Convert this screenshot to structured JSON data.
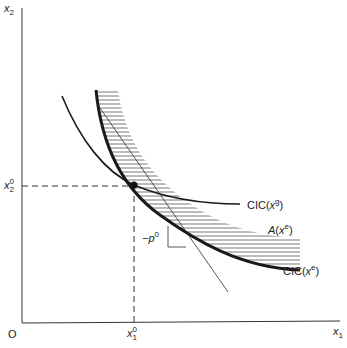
{
  "diagram": {
    "axes": {
      "y_label": "x",
      "y_label_sub": "2",
      "x_label": "x",
      "x_label_sub": "1",
      "origin_label": "O"
    },
    "ticks": {
      "x2_0": {
        "base": "x",
        "sub": "2",
        "sup": "0"
      },
      "x1_0": {
        "base": "x",
        "sub": "1",
        "sup": "0"
      }
    },
    "curves": {
      "cic_g": {
        "label_prefix": "CIC(",
        "label_var": "x",
        "label_sup": "g",
        "label_suffix": ")"
      },
      "cic_e": {
        "label_prefix": "CIC(",
        "label_var": "x",
        "label_sup": "e",
        "label_suffix": ")"
      },
      "region": {
        "label_var": "A",
        "label_paren_open": "(",
        "label_x": "x",
        "label_sup": "e",
        "label_paren_close": ")"
      },
      "price_line": {
        "label": "−p",
        "label_sup": "0"
      }
    },
    "colors": {
      "line": "#1a1a1a",
      "thin_line": "#444444",
      "hatch": "#555555",
      "axis": "#333333"
    }
  }
}
